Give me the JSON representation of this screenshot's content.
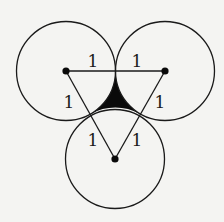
{
  "diagram": {
    "colors": {
      "background": "#f4f4f2",
      "stroke": "#1a1a1a",
      "shaded_region": "#0a0a0a"
    },
    "circles": [
      {
        "name": "left",
        "cx": 66,
        "cy": 71,
        "r": 49.5
      },
      {
        "name": "right",
        "cx": 165,
        "cy": 71,
        "r": 49.5
      },
      {
        "name": "bottom",
        "cx": 115,
        "cy": 159,
        "r": 49.5
      }
    ],
    "labels": [
      {
        "text": "1",
        "x": 93,
        "y": 67
      },
      {
        "text": "1",
        "x": 137,
        "y": 67
      },
      {
        "text": "1",
        "x": 69,
        "y": 108
      },
      {
        "text": "1",
        "x": 160,
        "y": 108
      },
      {
        "text": "1",
        "x": 93,
        "y": 146
      },
      {
        "text": "1",
        "x": 137,
        "y": 146
      }
    ]
  }
}
